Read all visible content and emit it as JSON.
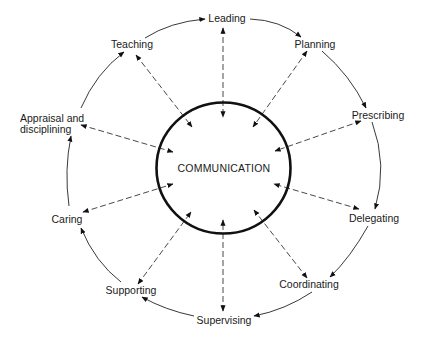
{
  "diagram": {
    "type": "cycle-with-hub",
    "center": {
      "label": "COMMUNICATION"
    },
    "nodes": [
      {
        "id": "leading",
        "label": "Leading"
      },
      {
        "id": "planning",
        "label": "Planning"
      },
      {
        "id": "prescribing",
        "label": "Prescribing"
      },
      {
        "id": "delegating",
        "label": "Delegating"
      },
      {
        "id": "coordinating",
        "label": "Coordinating"
      },
      {
        "id": "supervising",
        "label": "Supervising"
      },
      {
        "id": "supporting",
        "label": "Supporting"
      },
      {
        "id": "caring",
        "label": "Caring"
      },
      {
        "id": "appraisal",
        "label": "Appraisal and disciplining",
        "lines": [
          "Appraisal and",
          "disciplining"
        ]
      },
      {
        "id": "teaching",
        "label": "Teaching"
      }
    ],
    "cycle_edges": [
      [
        "leading",
        "planning"
      ],
      [
        "planning",
        "prescribing"
      ],
      [
        "prescribing",
        "delegating"
      ],
      [
        "delegating",
        "coordinating"
      ],
      [
        "coordinating",
        "supervising"
      ],
      [
        "supervising",
        "supporting"
      ],
      [
        "supporting",
        "caring"
      ],
      [
        "caring",
        "appraisal"
      ],
      [
        "appraisal",
        "teaching"
      ],
      [
        "teaching",
        "leading"
      ]
    ],
    "hub_edges": {
      "style": "dashed",
      "direction": "bidirectional",
      "connects": "COMMUNICATION to every node"
    },
    "colors": {
      "background": "#ffffff",
      "lines": "#222222",
      "text": "#1a1a1a"
    }
  }
}
